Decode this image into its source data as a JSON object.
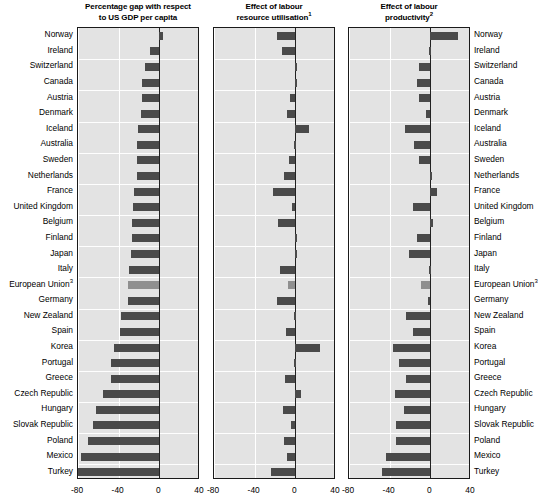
{
  "chart_data": {
    "type": "bar",
    "title": "",
    "orientation": "horizontal",
    "grid": true,
    "legend": false,
    "xlim": [
      -80,
      40
    ],
    "xticks": [
      -80,
      -40,
      0,
      40
    ],
    "xtick_labels": [
      "-80",
      "-40",
      "0",
      "40"
    ],
    "categories": [
      "Norway",
      "Ireland",
      "Switzerland",
      "Canada",
      "Austria",
      "Denmark",
      "Iceland",
      "Australia",
      "Sweden",
      "Netherlands",
      "France",
      "United Kingdom",
      "Belgium",
      "Finland",
      "Japan",
      "Italy",
      "European Union",
      "Germany",
      "New Zealand",
      "Spain",
      "Korea",
      "Portugal",
      "Greece",
      "Czech Republic",
      "Hungary",
      "Slovak Republic",
      "Poland",
      "Mexico",
      "Turkey"
    ],
    "category_superscripts": {
      "European Union": "3"
    },
    "panels": [
      {
        "id": "gap",
        "title_line1": "Percentage gap with respect",
        "title_line2": "to US GDP per capita",
        "superscript": "",
        "xlabel": "",
        "ylabel": "",
        "values": [
          4,
          -9,
          -14,
          -17,
          -17,
          -18,
          -21,
          -22,
          -22,
          -22,
          -25,
          -26,
          -27,
          -27,
          -28,
          -30,
          -31,
          -31,
          -38,
          -39,
          -45,
          -48,
          -48,
          -55,
          -62,
          -65,
          -70,
          -77,
          -83
        ]
      },
      {
        "id": "utilisation",
        "title_line1": "Effect of labour",
        "title_line2": "resource utilisation",
        "superscript": "1",
        "xlabel": "",
        "ylabel": "",
        "values": [
          -18,
          -13,
          0,
          0,
          -5,
          -8,
          13,
          -1,
          -6,
          -11,
          -22,
          -3,
          -17,
          0,
          2,
          -15,
          -7,
          -18,
          -1,
          -9,
          24,
          -1,
          -10,
          6,
          -12,
          -4,
          -11,
          -8,
          -24
        ]
      },
      {
        "id": "productivity",
        "title_line1": "Effect of labour",
        "title_line2": "productivity",
        "superscript": "2",
        "xlabel": "",
        "ylabel": "",
        "values": [
          27,
          -1,
          -11,
          -13,
          -11,
          -4,
          -25,
          -16,
          -11,
          0,
          7,
          -17,
          3,
          -13,
          -21,
          -1,
          -9,
          -2,
          -24,
          -17,
          -37,
          -31,
          -24,
          -35,
          -26,
          -34,
          -34,
          -44,
          -48
        ]
      }
    ]
  }
}
